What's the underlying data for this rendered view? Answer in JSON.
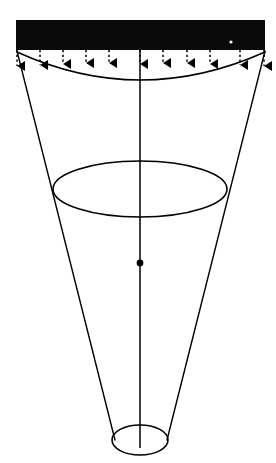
{
  "figure": {
    "name": "tapered-cone-distributed-load-diagram",
    "canvas": {
      "width": 276,
      "height": 463
    },
    "background_color": "#ffffff",
    "ink_color": "#000000"
  },
  "load_bar": {
    "name": "distributed-load-bar",
    "fill_color": "#0a0a0a",
    "x": 16,
    "y": 20,
    "width": 249,
    "height": 30
  },
  "load_arrows": {
    "name": "distributed-load-arrows",
    "count": 11,
    "style": "dashed-shaft-solid-head",
    "color": "#000000",
    "shaft_top_y": 50,
    "head_tip_y": 74,
    "head_half_width": 5,
    "head_height": 8,
    "x_positions": [
      17,
      40,
      63,
      86,
      109,
      140,
      163,
      187,
      210,
      240,
      264
    ],
    "tip_y_positions": [
      74,
      73,
      72,
      71,
      71,
      72,
      71,
      71,
      72,
      73,
      74
    ]
  },
  "top_arc": {
    "name": "cone-top-concave-arc",
    "left_x": 17,
    "left_y": 52,
    "right_x": 265,
    "right_y": 52,
    "control_x": 140,
    "control_y": 108,
    "stroke_width": 1.6
  },
  "cone_left_edge": {
    "name": "cone-left-generator",
    "x1": 17,
    "y1": 51,
    "x2": 115,
    "y2": 440,
    "stroke_width": 1.4
  },
  "cone_right_edge": {
    "name": "cone-right-generator",
    "x1": 265,
    "y1": 51,
    "x2": 167,
    "y2": 440,
    "stroke_width": 1.4
  },
  "mid_ellipse": {
    "name": "cone-mid-cross-section-ellipse",
    "cx": 140,
    "cy": 189,
    "rx": 87,
    "ry": 28,
    "stroke_width": 1.6
  },
  "bottom_ellipse": {
    "name": "cone-bottom-ellipse",
    "cx": 140,
    "cy": 440,
    "rx": 28,
    "ry": 15,
    "stroke_width": 1.6
  },
  "center_axis": {
    "name": "cone-center-axis-line",
    "x": 140,
    "y1": 50,
    "y2": 448,
    "stroke_width": 1.5
  },
  "centroid_marker": {
    "name": "centroid-dot",
    "cx": 140,
    "cy": 263,
    "r": 3.4,
    "fill_color": "#000000"
  },
  "speck_marker": {
    "name": "bar-white-speck",
    "cx": 231,
    "cy": 42,
    "r": 1.6,
    "fill_color": "#ffffff"
  }
}
